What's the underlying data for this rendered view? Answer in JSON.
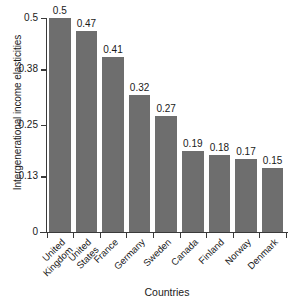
{
  "chart_data": {
    "type": "bar",
    "title": "",
    "xlabel": "Countries",
    "ylabel": "Intergenerational income elasticities",
    "categories": [
      "United Kingdom",
      "United States",
      "France",
      "Germany",
      "Sweden",
      "Canada",
      "Finland",
      "Norway",
      "Denmark"
    ],
    "category_lines": [
      [
        "United",
        "Kingdom"
      ],
      [
        "United",
        "States"
      ],
      [
        "France",
        ""
      ],
      [
        "Germany",
        ""
      ],
      [
        "Sweden",
        ""
      ],
      [
        "Canada",
        ""
      ],
      [
        "Finland",
        ""
      ],
      [
        "Norway",
        ""
      ],
      [
        "Denmark",
        ""
      ]
    ],
    "values": [
      0.5,
      0.47,
      0.41,
      0.32,
      0.27,
      0.19,
      0.18,
      0.17,
      0.15
    ],
    "value_labels": [
      "0.5",
      "0.47",
      "0.41",
      "0.32",
      "0.27",
      "0.19",
      "0.18",
      "0.17",
      "0.15"
    ],
    "ylim": [
      0,
      0.5
    ],
    "yticks": [
      0,
      0.13,
      0.25,
      0.38,
      0.5
    ],
    "ytick_labels": [
      "0",
      "0.13",
      "0.25",
      "0.38",
      "0.5"
    ],
    "grid": false,
    "legend": null,
    "bar_color": "#6e6e6e",
    "axis_color": "#3a3a3a",
    "background_color": "#ffffff"
  }
}
